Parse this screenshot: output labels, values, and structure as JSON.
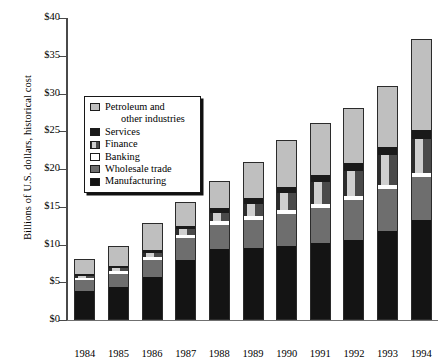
{
  "chart_data": {
    "type": "bar",
    "subtype": "stacked-bar",
    "title": "",
    "xlabel": "",
    "ylabel": "Billions of U.S. dollars, historical cost",
    "ylim": [
      0,
      40
    ],
    "ytick_values": [
      0,
      5,
      10,
      15,
      20,
      25,
      30,
      35,
      40
    ],
    "ytick_labels": [
      "$0",
      "$5",
      "$10",
      "$15",
      "$20",
      "$25",
      "$30",
      "$35",
      "$40"
    ],
    "grid": false,
    "legend_position": "upper-left-inside",
    "categories": [
      "1984",
      "1985",
      "1986",
      "1987",
      "1988",
      "1989",
      "1990",
      "1991",
      "1992",
      "1993",
      "1994"
    ],
    "series": [
      {
        "name": "Manufacturing",
        "color": "#141414",
        "values": [
          3.9,
          4.4,
          5.7,
          8.0,
          9.4,
          9.6,
          9.8,
          10.2,
          10.6,
          11.8,
          13.2
        ]
      },
      {
        "name": "Wholesale trade",
        "color": "#6e6e6e",
        "values": [
          1.4,
          1.7,
          2.3,
          2.9,
          3.2,
          3.7,
          4.3,
          4.7,
          5.3,
          5.6,
          5.8
        ]
      },
      {
        "name": "Banking",
        "color": "#ffffff",
        "values": [
          0.3,
          0.4,
          0.4,
          0.4,
          0.5,
          0.5,
          0.5,
          0.5,
          0.5,
          0.5,
          0.5
        ]
      },
      {
        "name": "Finance",
        "color": "#3a3a3a",
        "values": [
          0.3,
          0.4,
          0.5,
          0.7,
          1.1,
          1.6,
          2.2,
          2.9,
          3.4,
          3.9,
          4.5
        ]
      },
      {
        "name": "Services",
        "color": "#1a1a1a",
        "values": [
          0.2,
          0.3,
          0.4,
          0.5,
          0.6,
          0.7,
          0.8,
          0.9,
          1.0,
          1.1,
          1.2
        ]
      },
      {
        "name": "Petroleum and other industries",
        "color": "#bfbfbf",
        "values": [
          2.0,
          2.6,
          3.6,
          3.1,
          3.6,
          4.8,
          6.2,
          6.9,
          7.3,
          8.1,
          12.0
        ]
      }
    ],
    "totals": [
      8.1,
      9.8,
      12.9,
      15.6,
      18.4,
      20.9,
      23.8,
      26.1,
      28.1,
      31.0,
      37.2
    ]
  },
  "legend": {
    "items": [
      {
        "label": "Petroleum and",
        "label2": "other industries",
        "swatch": "petroleum"
      },
      {
        "label": "Services",
        "swatch": "services"
      },
      {
        "label": "Finance",
        "swatch": "finance"
      },
      {
        "label": "Banking",
        "swatch": "banking"
      },
      {
        "label": "Wholesale trade",
        "swatch": "wholesale"
      },
      {
        "label": "Manufacturing",
        "swatch": "manufacturing"
      }
    ]
  }
}
